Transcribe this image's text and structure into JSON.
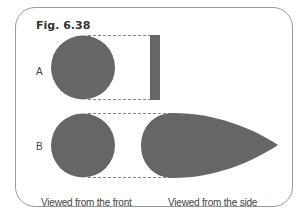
{
  "figure": {
    "title": "Fig. 6.38",
    "rows": [
      {
        "label": "A",
        "front_shape": "circle",
        "side_shape": "thin-rectangle"
      },
      {
        "label": "B",
        "front_shape": "circle",
        "side_shape": "teardrop"
      }
    ],
    "captions": {
      "front": "Viewed from the front",
      "side": "Viewed from the side"
    },
    "colors": {
      "shape_fill": "#666666",
      "frame_border": "#9a9a9a",
      "dashed_line": "#888888",
      "text": "#444444"
    }
  }
}
